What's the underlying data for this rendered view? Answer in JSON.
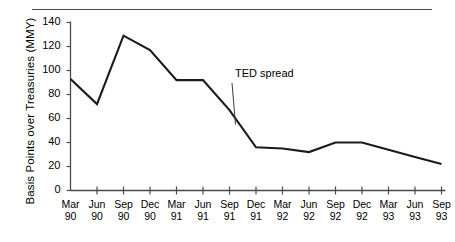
{
  "figure": {
    "top_rule": true,
    "background": "#ffffff",
    "line_color": "#1a1a1a",
    "axis_color": "#4a4a4a"
  },
  "chart_data": {
    "type": "line",
    "title": "",
    "xlabel": "",
    "ylabel": "Basis Points over Treasuries (MMY)",
    "ylim": [
      0,
      140
    ],
    "yticks": [
      0,
      20,
      40,
      60,
      80,
      100,
      120,
      140
    ],
    "ytick_labels": [
      "0",
      "20",
      "40",
      "60",
      "80",
      "100",
      "120",
      "140"
    ],
    "grid": false,
    "legend": "none",
    "categories": [
      "Mar 90",
      "Jun 90",
      "Sep 90",
      "Dec 90",
      "Mar 91",
      "Jun 91",
      "Sep 91",
      "Dec 91",
      "Mar 92",
      "Jun 92",
      "Sep 92",
      "Dec 92",
      "Mar 93",
      "Jun 93",
      "Sep 93"
    ],
    "xtick_months": [
      "Mar",
      "Jun",
      "Sep",
      "Dec",
      "Mar",
      "Jun",
      "Sep",
      "Dec",
      "Mar",
      "Jun",
      "Sep",
      "Dec",
      "Mar",
      "Jun",
      "Sep"
    ],
    "xtick_years": [
      "90",
      "90",
      "90",
      "90",
      "91",
      "91",
      "91",
      "91",
      "92",
      "92",
      "92",
      "92",
      "93",
      "93",
      "93"
    ],
    "series": [
      {
        "name": "TED spread",
        "values": [
          93,
          72,
          129,
          117,
          92,
          92,
          67,
          36,
          35,
          32,
          40,
          40,
          34,
          28,
          22
        ]
      }
    ],
    "annotations": [
      {
        "text": "TED spread",
        "target_category": "Sep 91",
        "target_value": 55
      }
    ]
  }
}
